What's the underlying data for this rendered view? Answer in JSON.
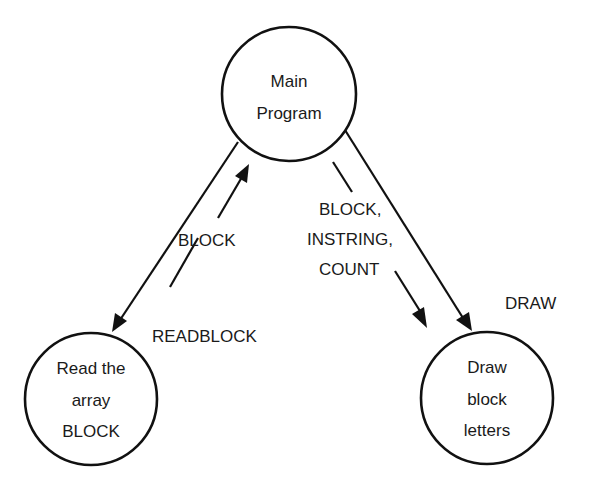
{
  "diagram": {
    "type": "structure-chart",
    "nodes": [
      {
        "id": "main",
        "lines": [
          "Main",
          "Program"
        ],
        "cx": 289,
        "cy": 94,
        "r": 67
      },
      {
        "id": "readblock",
        "lines": [
          "Read the",
          "array",
          "BLOCK"
        ],
        "cx": 91,
        "cy": 399,
        "r": 66
      },
      {
        "id": "draw",
        "lines": [
          "Draw",
          "block",
          "letters"
        ],
        "cx": 487,
        "cy": 398,
        "r": 66
      }
    ],
    "edges": [
      {
        "from": "main",
        "to": "readblock",
        "label": "READBLOCK",
        "kind": "call"
      },
      {
        "from": "main",
        "to": "draw",
        "label": "DRAW",
        "kind": "call"
      }
    ],
    "data_flows": [
      {
        "direction": "up",
        "from": "readblock",
        "to": "main",
        "label": "BLOCK"
      },
      {
        "direction": "down",
        "from": "main",
        "to": "draw",
        "label_lines": [
          "BLOCK,",
          "INSTRING,",
          "COUNT"
        ]
      }
    ],
    "colors": {
      "ink": "#111111",
      "background": "#ffffff"
    }
  }
}
